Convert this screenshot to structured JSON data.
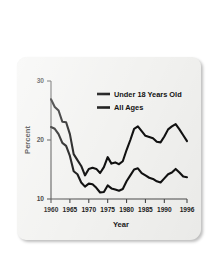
{
  "figure": {
    "background_color": "#f2f2f0",
    "page_color": "#ffffff",
    "line_color": "#111111"
  },
  "chart_data": {
    "type": "line",
    "title": "",
    "xlabel": "Year",
    "ylabel": "Percent",
    "xlim": [
      1960,
      1996
    ],
    "ylim": [
      10,
      30
    ],
    "xticks": [
      1960,
      1965,
      1970,
      1975,
      1980,
      1985,
      1990,
      1996
    ],
    "xtick_labels": [
      "1960",
      "1965",
      "1970",
      "1975",
      "1980",
      "1985",
      "1990",
      "1996"
    ],
    "yticks": [
      10,
      20,
      30
    ],
    "ytick_labels": [
      "10",
      "20",
      "30"
    ],
    "grid": false,
    "legend_position": "upper right",
    "x": [
      1960,
      1961,
      1962,
      1963,
      1964,
      1965,
      1966,
      1967,
      1968,
      1969,
      1970,
      1971,
      1972,
      1973,
      1974,
      1975,
      1976,
      1977,
      1978,
      1979,
      1980,
      1981,
      1982,
      1983,
      1984,
      1985,
      1986,
      1987,
      1988,
      1989,
      1990,
      1991,
      1992,
      1993,
      1994,
      1995,
      1996
    ],
    "series": [
      {
        "name": "Under 18 Years Old",
        "values": [
          26.9,
          25.6,
          25.0,
          23.1,
          23.0,
          21.0,
          17.6,
          16.6,
          15.6,
          14.0,
          15.1,
          15.3,
          15.1,
          14.4,
          15.4,
          17.1,
          16.0,
          16.2,
          15.9,
          16.4,
          18.3,
          20.0,
          21.9,
          22.3,
          21.5,
          20.7,
          20.5,
          20.3,
          19.7,
          19.6,
          20.6,
          21.8,
          22.3,
          22.7,
          21.8,
          20.8,
          19.8
        ]
      },
      {
        "name": "All Ages",
        "values": [
          22.2,
          21.9,
          21.0,
          19.5,
          19.0,
          17.3,
          14.7,
          14.2,
          12.8,
          12.1,
          12.6,
          12.5,
          11.9,
          11.1,
          11.2,
          12.3,
          11.8,
          11.6,
          11.4,
          11.7,
          13.0,
          14.0,
          15.0,
          15.2,
          14.4,
          14.0,
          13.6,
          13.4,
          13.0,
          12.8,
          13.5,
          14.2,
          14.5,
          15.1,
          14.5,
          13.8,
          13.7
        ]
      }
    ],
    "legend": [
      {
        "label": "Under 18 Years Old",
        "color": "#111111"
      },
      {
        "label": "All Ages",
        "color": "#111111"
      }
    ]
  }
}
